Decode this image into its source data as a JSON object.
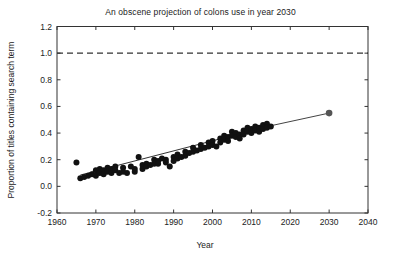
{
  "chart_data": {
    "type": "scatter",
    "title": "An obscene projection of colons use in year 2030",
    "xlabel": "Year",
    "ylabel": "Proportion of titles containing search term",
    "xlim": [
      1960,
      2040
    ],
    "ylim": [
      -0.2,
      1.2
    ],
    "xticks": [
      1960,
      1970,
      1980,
      1990,
      2000,
      2010,
      2020,
      2030,
      2040
    ],
    "xtick_labels": [
      "1960",
      "1970",
      "1980",
      "1990",
      "2000",
      "2010",
      "2020",
      "2030",
      "2040"
    ],
    "yticks": [
      -0.2,
      0.0,
      0.2,
      0.4,
      0.6,
      0.8,
      1.0,
      1.2
    ],
    "ytick_labels": [
      "-0.2",
      "0.0",
      "0.2",
      "0.4",
      "0.6",
      "0.8",
      "1.0",
      "1.2"
    ],
    "grid": false,
    "legend": "none",
    "marker_color": "#111111",
    "marker_size": 6,
    "trend_line_color": "#333333",
    "reference_line": {
      "y": 1.0,
      "style": "dashed",
      "color": "#333333"
    },
    "projection_point": {
      "x": 2030,
      "y": 0.55,
      "color": "#555555",
      "label": "projection 2030"
    },
    "series": [
      {
        "name": "observed",
        "x": [
          1965,
          1966,
          1967,
          1968,
          1969,
          1970,
          1970,
          1971,
          1971,
          1972,
          1972,
          1973,
          1973,
          1974,
          1974,
          1975,
          1975,
          1976,
          1977,
          1977,
          1978,
          1979,
          1980,
          1980,
          1981,
          1982,
          1982,
          1983,
          1983,
          1984,
          1985,
          1985,
          1986,
          1986,
          1987,
          1988,
          1988,
          1989,
          1990,
          1990,
          1991,
          1991,
          1992,
          1993,
          1993,
          1994,
          1995,
          1995,
          1996,
          1997,
          1997,
          1998,
          1999,
          1999,
          2000,
          2000,
          2001,
          2002,
          2002,
          2003,
          2003,
          2004,
          2004,
          2005,
          2005,
          2006,
          2006,
          2007,
          2007,
          2008,
          2008,
          2009,
          2009,
          2010,
          2010,
          2011,
          2011,
          2012,
          2012,
          2013,
          2013,
          2014,
          2014,
          2015
        ],
        "y": [
          0.18,
          0.06,
          0.07,
          0.08,
          0.09,
          0.12,
          0.08,
          0.13,
          0.1,
          0.12,
          0.09,
          0.14,
          0.11,
          0.13,
          0.1,
          0.15,
          0.12,
          0.1,
          0.14,
          0.11,
          0.1,
          0.15,
          0.13,
          0.11,
          0.22,
          0.16,
          0.13,
          0.17,
          0.15,
          0.16,
          0.2,
          0.17,
          0.19,
          0.17,
          0.21,
          0.2,
          0.18,
          0.15,
          0.22,
          0.19,
          0.24,
          0.21,
          0.22,
          0.26,
          0.23,
          0.25,
          0.29,
          0.26,
          0.27,
          0.31,
          0.28,
          0.29,
          0.33,
          0.3,
          0.34,
          0.31,
          0.3,
          0.36,
          0.33,
          0.38,
          0.35,
          0.37,
          0.34,
          0.41,
          0.38,
          0.4,
          0.37,
          0.39,
          0.36,
          0.42,
          0.39,
          0.44,
          0.41,
          0.43,
          0.4,
          0.45,
          0.42,
          0.44,
          0.41,
          0.46,
          0.43,
          0.47,
          0.44,
          0.45
        ]
      }
    ],
    "trend_line": {
      "x": [
        1966,
        2015
      ],
      "y": [
        0.085,
        0.455
      ]
    },
    "projection_line": {
      "x": [
        2015,
        2030
      ],
      "y": [
        0.455,
        0.55
      ]
    }
  }
}
